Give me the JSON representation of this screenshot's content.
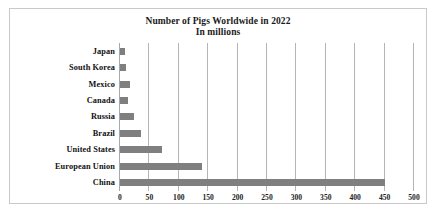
{
  "chart_data": {
    "type": "bar",
    "orientation": "horizontal",
    "title": "Number of Pigs Worldwide in 2022",
    "subtitle": "In millions",
    "xlabel": "",
    "ylabel": "",
    "categories": [
      "Japan",
      "South Korea",
      "Mexico",
      "Canada",
      "Russia",
      "Brazil",
      "United States",
      "European Union",
      "China"
    ],
    "values": [
      9,
      11,
      17,
      14,
      23,
      35,
      72,
      140,
      450
    ],
    "xlim": [
      0,
      500
    ],
    "xticks": [
      0,
      50,
      100,
      150,
      200,
      250,
      300,
      350,
      400,
      450,
      500
    ],
    "xtick_labels": [
      "0",
      "50",
      "100",
      "150",
      "200",
      "250",
      "300",
      "350",
      "400",
      "450",
      "500"
    ],
    "grid": "vertical",
    "legend": "none",
    "bar_color": "#7f7f7f",
    "gridline_color": "#b5b5b5",
    "axis_color": "#a8a8a8",
    "frame_color": "#c9c9c9",
    "background_color": "#ffffff",
    "text_color": "#111111"
  }
}
